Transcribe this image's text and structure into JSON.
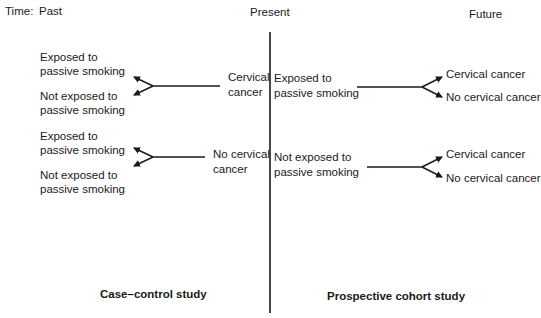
{
  "timeline": {
    "label": "Time:",
    "past": "Past",
    "present": "Present",
    "future": "Future"
  },
  "case_control": {
    "title": "Case–control study",
    "groups": [
      {
        "outcome": [
          "Cervical",
          "cancer"
        ],
        "exposures": [
          [
            "Exposed to",
            "passive smoking"
          ],
          [
            "Not exposed to",
            "passive smoking"
          ]
        ]
      },
      {
        "outcome": [
          "No cervical",
          "cancer"
        ],
        "exposures": [
          [
            "Exposed to",
            "passive smoking"
          ],
          [
            "Not exposed to",
            "passive smoking"
          ]
        ]
      }
    ]
  },
  "cohort": {
    "title": "Prospective cohort study",
    "groups": [
      {
        "exposure": [
          "Exposed to",
          "passive smoking"
        ],
        "outcomes": [
          "Cervical cancer",
          "No cervical cancer"
        ]
      },
      {
        "exposure": [
          "Not exposed to",
          "passive smoking"
        ],
        "outcomes": [
          "Cervical cancer",
          "No cervical cancer"
        ]
      }
    ]
  },
  "colors": {
    "ink": "#1a1a1a",
    "background": "#ffffff"
  }
}
